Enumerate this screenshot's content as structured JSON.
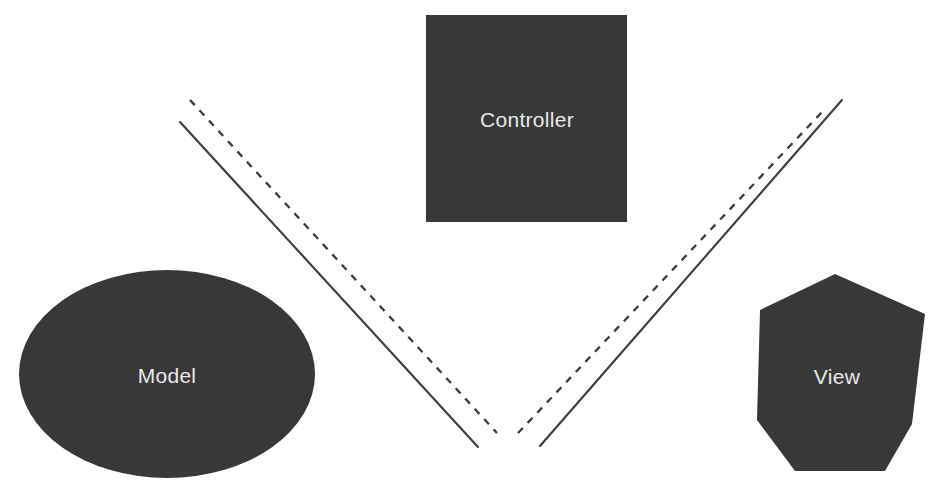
{
  "diagram": {
    "background_color": "#ffffff",
    "shape_fill_color": "#393939",
    "label_color": "#e8e8e8",
    "line_color": "#3b3b42",
    "nodes": [
      {
        "id": "controller",
        "label": "Controller",
        "shape": "square",
        "x": 426,
        "y": 15,
        "width": 201,
        "height": 207,
        "label_x": 527,
        "label_y": 121
      },
      {
        "id": "model",
        "label": "Model",
        "shape": "ellipse",
        "cx": 167,
        "cy": 374,
        "rx": 148,
        "ry": 104,
        "label_x": 167,
        "label_y": 377
      },
      {
        "id": "view",
        "label": "View",
        "shape": "heptagon",
        "points": "835,274 925,314 912,424 885,471 795,471 757,420 760,310",
        "label_x": 837,
        "label_y": 378
      }
    ],
    "connectors": [
      {
        "id": "model-to-controller-solid",
        "style": "solid",
        "from": "model",
        "to": "controller",
        "x1": 180,
        "y1": 122,
        "x2": 478,
        "y2": 447
      },
      {
        "id": "controller-to-model-dashed",
        "style": "dashed",
        "from": "controller",
        "to": "model",
        "x1": 190,
        "y1": 100,
        "x2": 497,
        "y2": 433
      },
      {
        "id": "view-to-controller-dashed",
        "style": "dashed",
        "from": "view",
        "to": "controller",
        "x1": 518,
        "y1": 433,
        "x2": 823,
        "y2": 111
      },
      {
        "id": "controller-to-view-solid",
        "style": "solid",
        "from": "controller",
        "to": "view",
        "x1": 540,
        "y1": 446,
        "x2": 842,
        "y2": 100
      }
    ]
  }
}
